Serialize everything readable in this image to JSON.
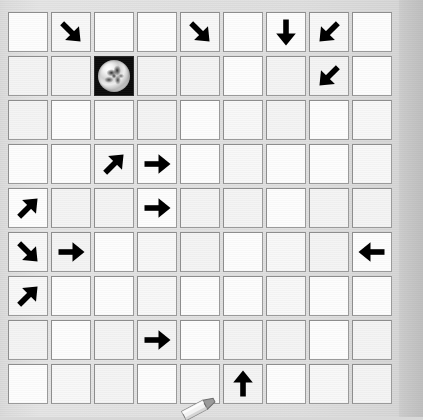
{
  "app": {
    "title": "Arrow Grid Board",
    "surface_color": "#dcdcdc",
    "cell_color": "#fbfbfb",
    "cell_border_color": "#8d8d8d",
    "arrow_color": "#000000",
    "marble_cell_color": "#0a0a0a"
  },
  "board": {
    "name": "arrow-grid",
    "columns": 9,
    "rows": 9,
    "cell_size_px": 40,
    "origin_px": {
      "x": 8,
      "y": 12
    },
    "column_gap_px": 3,
    "row_gap_px": 4,
    "legend": {
      "empty": "",
      "right": "→",
      "left": "←",
      "up": "↑",
      "down": "↓",
      "up-right": "↗",
      "up-left": "↖",
      "down-right": "↘",
      "down-left": "↙",
      "marble": "marble"
    },
    "cells": [
      [
        {
          "r": 1,
          "c": 1,
          "icon": "empty",
          "label": ""
        },
        {
          "r": 1,
          "c": 2,
          "icon": "down-right",
          "label": "↘"
        },
        {
          "r": 1,
          "c": 3,
          "icon": "empty",
          "label": ""
        },
        {
          "r": 1,
          "c": 4,
          "icon": "empty",
          "label": ""
        },
        {
          "r": 1,
          "c": 5,
          "icon": "down-right",
          "label": "↘"
        },
        {
          "r": 1,
          "c": 6,
          "icon": "empty",
          "label": ""
        },
        {
          "r": 1,
          "c": 7,
          "icon": "down",
          "label": "↓"
        },
        {
          "r": 1,
          "c": 8,
          "icon": "down-left",
          "label": "↙"
        },
        {
          "r": 1,
          "c": 9,
          "icon": "empty",
          "label": ""
        }
      ],
      [
        {
          "r": 2,
          "c": 1,
          "icon": "empty",
          "label": ""
        },
        {
          "r": 2,
          "c": 2,
          "icon": "empty",
          "label": ""
        },
        {
          "r": 2,
          "c": 3,
          "icon": "marble",
          "label": "marble"
        },
        {
          "r": 2,
          "c": 4,
          "icon": "empty",
          "label": ""
        },
        {
          "r": 2,
          "c": 5,
          "icon": "empty",
          "label": ""
        },
        {
          "r": 2,
          "c": 6,
          "icon": "empty",
          "label": ""
        },
        {
          "r": 2,
          "c": 7,
          "icon": "empty",
          "label": ""
        },
        {
          "r": 2,
          "c": 8,
          "icon": "down-left",
          "label": "↙"
        },
        {
          "r": 2,
          "c": 9,
          "icon": "empty",
          "label": ""
        }
      ],
      [
        {
          "r": 3,
          "c": 1,
          "icon": "empty",
          "label": ""
        },
        {
          "r": 3,
          "c": 2,
          "icon": "empty",
          "label": ""
        },
        {
          "r": 3,
          "c": 3,
          "icon": "empty",
          "label": ""
        },
        {
          "r": 3,
          "c": 4,
          "icon": "empty",
          "label": ""
        },
        {
          "r": 3,
          "c": 5,
          "icon": "empty",
          "label": ""
        },
        {
          "r": 3,
          "c": 6,
          "icon": "empty",
          "label": ""
        },
        {
          "r": 3,
          "c": 7,
          "icon": "empty",
          "label": ""
        },
        {
          "r": 3,
          "c": 8,
          "icon": "empty",
          "label": ""
        },
        {
          "r": 3,
          "c": 9,
          "icon": "empty",
          "label": ""
        }
      ],
      [
        {
          "r": 4,
          "c": 1,
          "icon": "empty",
          "label": ""
        },
        {
          "r": 4,
          "c": 2,
          "icon": "empty",
          "label": ""
        },
        {
          "r": 4,
          "c": 3,
          "icon": "up-right",
          "label": "↗"
        },
        {
          "r": 4,
          "c": 4,
          "icon": "right",
          "label": "→"
        },
        {
          "r": 4,
          "c": 5,
          "icon": "empty",
          "label": ""
        },
        {
          "r": 4,
          "c": 6,
          "icon": "empty",
          "label": ""
        },
        {
          "r": 4,
          "c": 7,
          "icon": "empty",
          "label": ""
        },
        {
          "r": 4,
          "c": 8,
          "icon": "empty",
          "label": ""
        },
        {
          "r": 4,
          "c": 9,
          "icon": "empty",
          "label": ""
        }
      ],
      [
        {
          "r": 5,
          "c": 1,
          "icon": "up-right",
          "label": "↗"
        },
        {
          "r": 5,
          "c": 2,
          "icon": "empty",
          "label": ""
        },
        {
          "r": 5,
          "c": 3,
          "icon": "empty",
          "label": ""
        },
        {
          "r": 5,
          "c": 4,
          "icon": "right",
          "label": "→"
        },
        {
          "r": 5,
          "c": 5,
          "icon": "empty",
          "label": ""
        },
        {
          "r": 5,
          "c": 6,
          "icon": "empty",
          "label": ""
        },
        {
          "r": 5,
          "c": 7,
          "icon": "empty",
          "label": ""
        },
        {
          "r": 5,
          "c": 8,
          "icon": "empty",
          "label": ""
        },
        {
          "r": 5,
          "c": 9,
          "icon": "empty",
          "label": ""
        }
      ],
      [
        {
          "r": 6,
          "c": 1,
          "icon": "down-right",
          "label": "↘"
        },
        {
          "r": 6,
          "c": 2,
          "icon": "right",
          "label": "→"
        },
        {
          "r": 6,
          "c": 3,
          "icon": "empty",
          "label": ""
        },
        {
          "r": 6,
          "c": 4,
          "icon": "empty",
          "label": ""
        },
        {
          "r": 6,
          "c": 5,
          "icon": "empty",
          "label": ""
        },
        {
          "r": 6,
          "c": 6,
          "icon": "empty",
          "label": ""
        },
        {
          "r": 6,
          "c": 7,
          "icon": "empty",
          "label": ""
        },
        {
          "r": 6,
          "c": 8,
          "icon": "empty",
          "label": ""
        },
        {
          "r": 6,
          "c": 9,
          "icon": "left",
          "label": "←"
        }
      ],
      [
        {
          "r": 7,
          "c": 1,
          "icon": "up-right",
          "label": "↗"
        },
        {
          "r": 7,
          "c": 2,
          "icon": "empty",
          "label": ""
        },
        {
          "r": 7,
          "c": 3,
          "icon": "empty",
          "label": ""
        },
        {
          "r": 7,
          "c": 4,
          "icon": "empty",
          "label": ""
        },
        {
          "r": 7,
          "c": 5,
          "icon": "empty",
          "label": ""
        },
        {
          "r": 7,
          "c": 6,
          "icon": "empty",
          "label": ""
        },
        {
          "r": 7,
          "c": 7,
          "icon": "empty",
          "label": ""
        },
        {
          "r": 7,
          "c": 8,
          "icon": "empty",
          "label": ""
        },
        {
          "r": 7,
          "c": 9,
          "icon": "empty",
          "label": ""
        }
      ],
      [
        {
          "r": 8,
          "c": 1,
          "icon": "empty",
          "label": ""
        },
        {
          "r": 8,
          "c": 2,
          "icon": "empty",
          "label": ""
        },
        {
          "r": 8,
          "c": 3,
          "icon": "empty",
          "label": ""
        },
        {
          "r": 8,
          "c": 4,
          "icon": "right",
          "label": "→"
        },
        {
          "r": 8,
          "c": 5,
          "icon": "empty",
          "label": ""
        },
        {
          "r": 8,
          "c": 6,
          "icon": "empty",
          "label": ""
        },
        {
          "r": 8,
          "c": 7,
          "icon": "empty",
          "label": ""
        },
        {
          "r": 8,
          "c": 8,
          "icon": "empty",
          "label": ""
        },
        {
          "r": 8,
          "c": 9,
          "icon": "empty",
          "label": ""
        }
      ],
      [
        {
          "r": 9,
          "c": 1,
          "icon": "empty",
          "label": ""
        },
        {
          "r": 9,
          "c": 2,
          "icon": "empty",
          "label": ""
        },
        {
          "r": 9,
          "c": 3,
          "icon": "empty",
          "label": ""
        },
        {
          "r": 9,
          "c": 4,
          "icon": "empty",
          "label": ""
        },
        {
          "r": 9,
          "c": 5,
          "icon": "empty",
          "label": ""
        },
        {
          "r": 9,
          "c": 6,
          "icon": "up",
          "label": "↑"
        },
        {
          "r": 9,
          "c": 7,
          "icon": "empty",
          "label": ""
        },
        {
          "r": 9,
          "c": 8,
          "icon": "empty",
          "label": ""
        },
        {
          "r": 9,
          "c": 9,
          "icon": "empty",
          "label": ""
        }
      ]
    ]
  },
  "stylus": {
    "name": "stylus-eraser-token",
    "label": "",
    "position_px": {
      "x": 176,
      "y": 396
    }
  }
}
